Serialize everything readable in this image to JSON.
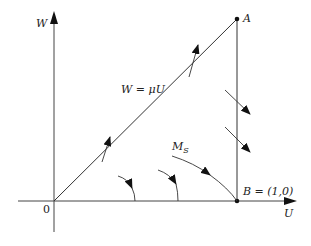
{
  "diagram": {
    "type": "phase-plane",
    "axes": {
      "x_label": "U",
      "y_label": "W",
      "origin_label": "0"
    },
    "points": {
      "A": {
        "label": "A"
      },
      "B": {
        "label_prefix": "B = ",
        "label_value": "(1,0)"
      }
    },
    "lines": {
      "diagonal": {
        "label": "W = μU"
      },
      "separatrix": {
        "label_main": "M",
        "label_sub": "S"
      }
    },
    "trajectories": [
      {
        "name": "arc-small",
        "direction": "clockwise-down"
      },
      {
        "name": "arc-medium",
        "direction": "clockwise-down"
      },
      {
        "name": "separatrix-MS",
        "direction": "toward-B"
      },
      {
        "name": "right-upper",
        "direction": "down-right"
      },
      {
        "name": "right-lower",
        "direction": "down-right"
      },
      {
        "name": "diagonal-lower",
        "direction": "up-crossing"
      },
      {
        "name": "diagonal-upper",
        "direction": "up-crossing"
      }
    ],
    "colors": {
      "line": "#333333",
      "axis": "#444444",
      "background": "#ffffff"
    }
  }
}
